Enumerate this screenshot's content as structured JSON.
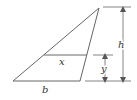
{
  "diagram": {
    "type": "geometry",
    "shape": "triangle",
    "labels": {
      "base": "b",
      "height": "h",
      "strip_width": "x",
      "strip_height": "y"
    },
    "colors": {
      "stroke": "#555555",
      "text": "#333333",
      "background": "#ffffff"
    }
  }
}
